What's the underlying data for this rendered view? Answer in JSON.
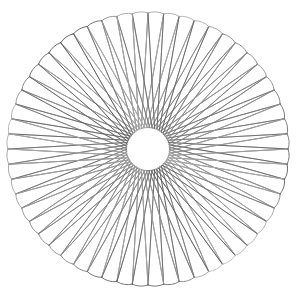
{
  "image": {
    "width": 298,
    "height": 303,
    "background_color": "#ffffff",
    "title": "Chord Rosette / String-Art Spirograph",
    "alt_text": "Monochrome radial string-art figure: many straight chords drawn between evenly spaced points on a circle, forming narrow elongated petals with rounded outer tips and a clear white circular hole at the center."
  },
  "chart_data": {
    "type": "line",
    "subtitle": "",
    "xlabel": "",
    "ylabel": "",
    "grid": false,
    "legend_position": "none",
    "axes_visible": false,
    "tick_labels_x": [],
    "tick_labels_y": [],
    "xlim": [
      8,
      288
    ],
    "ylim": [
      13,
      285
    ],
    "geometry": {
      "center_x": 148,
      "center_y": 149,
      "outer_radius_x": 140,
      "outer_radius_y": 136,
      "inner_hole_radius": 21,
      "point_count": 56,
      "chord_step": 27,
      "start_angle_deg": -90,
      "petal_count": 56,
      "petal_tip_rounding": 3.2
    },
    "stroke": {
      "width": 0.95,
      "min_gray": "#4a4a4a",
      "max_gray": "#c2c2c2",
      "linecap": "round",
      "opacity": 0.92
    },
    "series": [
      {
        "name": "chords",
        "description": "Straight segments joining vertex i to vertex (i + step) mod N around the circle",
        "values": [
          0,
          27,
          54,
          81,
          108,
          135,
          162,
          189,
          216,
          243,
          270,
          297,
          324,
          351,
          378,
          405,
          432,
          459,
          486,
          513,
          540,
          567,
          594,
          621,
          648,
          675,
          702,
          729,
          756,
          783,
          810,
          837,
          864,
          891,
          918,
          945,
          972,
          999,
          1026,
          1053,
          1080,
          1107,
          1134,
          1161,
          1188,
          1215,
          1242,
          1269,
          1296,
          1323,
          1350,
          1377,
          1404,
          1431,
          1458,
          1485
        ]
      },
      {
        "name": "petal-arcs",
        "description": "Rounded outer tips where consecutive chord endpoints nearly meet at the rim",
        "values": [
          56
        ]
      }
    ],
    "annotations": []
  },
  "figure": {
    "caption": "",
    "name": "chord-rosette"
  }
}
